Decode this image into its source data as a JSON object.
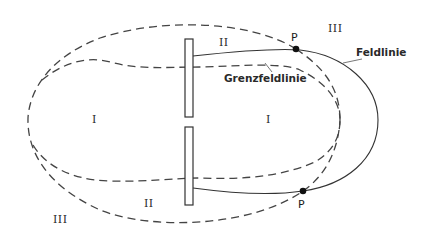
{
  "diagram": {
    "type": "field-line diagram",
    "regions": {
      "region_I_left": "I",
      "region_I_right": "I",
      "region_II_top": "II",
      "region_II_bottom": "II",
      "region_III_top": "III",
      "region_III_bottom": "III"
    },
    "points": {
      "top": "P",
      "bottom": "P"
    },
    "annotations": {
      "field_line": "Feldlinie",
      "boundary_field_line": "Grenzfeldlinie"
    },
    "elements": {
      "plates": 2,
      "line_styles": {
        "dashed": "boundary field lines",
        "solid": "field line through P"
      }
    },
    "colors": {
      "line": "#333333",
      "background": "#ffffff"
    }
  }
}
